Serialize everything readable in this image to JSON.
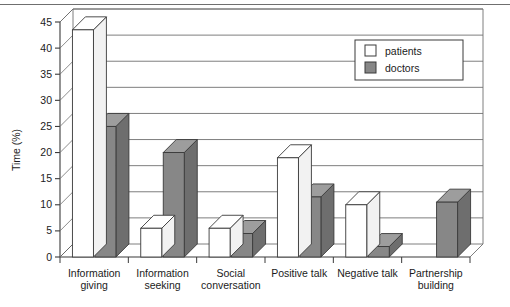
{
  "figure": {
    "top_rule": true,
    "plot_style": "3d-bar"
  },
  "chart_data": {
    "type": "bar",
    "title": "",
    "xlabel": "",
    "ylabel": "Time (%)",
    "ylim": [
      0,
      45
    ],
    "ytick_step": 5,
    "yticks": [
      "0",
      "5",
      "10",
      "15",
      "20",
      "25",
      "30",
      "35",
      "40",
      "45"
    ],
    "grid": true,
    "grid_axis": "y",
    "legend_position": "top-right",
    "categories": [
      "Information giving",
      "Information seeking",
      "Social conversation",
      "Positive talk",
      "Negative talk",
      "Partnership building"
    ],
    "category_lines": [
      [
        "Information",
        "giving"
      ],
      [
        "Information",
        "seeking"
      ],
      [
        "Social",
        "conversation"
      ],
      [
        "Positive talk",
        ""
      ],
      [
        "Negative talk",
        ""
      ],
      [
        "Partnership",
        "building"
      ]
    ],
    "series": [
      {
        "name": "patients",
        "color": "#ffffff",
        "edge": "#3a3a3a",
        "values": [
          43.5,
          5.5,
          5.5,
          19.0,
          10.0,
          0.0
        ]
      },
      {
        "name": "doctors",
        "color": "#878787",
        "edge": "#3a3a3a",
        "values": [
          25.0,
          20.0,
          4.5,
          11.5,
          2.0,
          10.5
        ]
      }
    ]
  },
  "legend": {
    "entries": [
      {
        "label": "patients",
        "swatch": "#ffffff"
      },
      {
        "label": "doctors",
        "swatch": "#878787"
      }
    ]
  },
  "colors": {
    "patients_fill": "#ffffff",
    "doctors_fill": "#878787",
    "doctors_top": "#9d9d9d",
    "doctors_side": "#6e6e6e",
    "patients_top": "#ffffff",
    "patients_side": "#f2f2f2",
    "axis": "#3a3a3a",
    "grid": "#6f6f6f",
    "rule": "#6f6f6f"
  }
}
